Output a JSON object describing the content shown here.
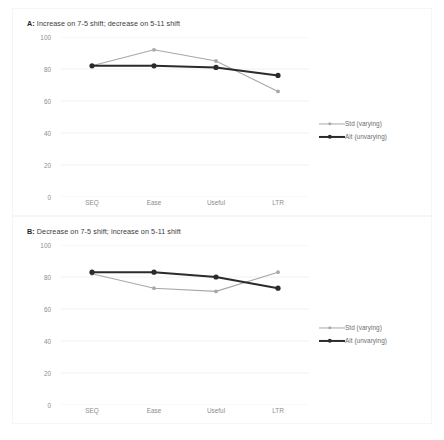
{
  "figure": {
    "accent_std": "#a8a8a8",
    "accent_alt": "#2b2b2b",
    "grid_color": "#f2f2f2",
    "text_color": "#8c8c8c"
  },
  "panels": [
    {
      "id": "A",
      "letter": "A:",
      "title": " Increase on 7-5 shift; decrease on 5-11 shift"
    },
    {
      "id": "B",
      "letter": "B:",
      "title": " Decrease on 7-5 shift; increase on 5-11 shift"
    }
  ],
  "legend": {
    "std_label": "Std (varying)",
    "alt_label": "Alt (unvarying)"
  },
  "chart_data": [
    {
      "type": "line",
      "title": "A: Increase on 7-5 shift; decrease on 5-11 shift",
      "categories": [
        "SEQ",
        "Ease",
        "Useful",
        "LTR"
      ],
      "series": [
        {
          "name": "Std (varying)",
          "values": [
            82,
            92,
            85,
            66
          ],
          "color": "#a8a8a8"
        },
        {
          "name": "Alt (unvarying)",
          "values": [
            82,
            82,
            81,
            76
          ],
          "color": "#2b2b2b"
        }
      ],
      "xlabel": "",
      "ylabel": "",
      "ylim": [
        0,
        100
      ],
      "yticks": [
        0,
        20,
        40,
        60,
        80,
        100
      ],
      "grid": true,
      "legend_position": "right"
    },
    {
      "type": "line",
      "title": "B: Decrease on 7-5 shift; increase on 5-11 shift",
      "categories": [
        "SEQ",
        "Ease",
        "Useful",
        "LTR"
      ],
      "series": [
        {
          "name": "Std (varying)",
          "values": [
            82,
            73,
            71,
            83
          ],
          "color": "#a8a8a8"
        },
        {
          "name": "Alt (unvarying)",
          "values": [
            83,
            83,
            80,
            73
          ],
          "color": "#2b2b2b"
        }
      ],
      "xlabel": "",
      "ylabel": "",
      "ylim": [
        0,
        100
      ],
      "yticks": [
        0,
        20,
        40,
        60,
        80,
        100
      ],
      "grid": true,
      "legend_position": "right"
    }
  ]
}
